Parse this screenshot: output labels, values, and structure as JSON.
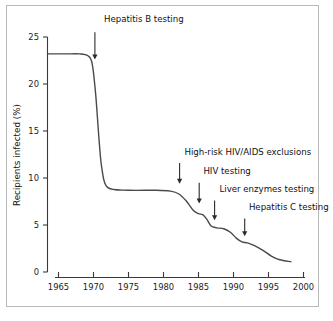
{
  "chart_data": {
    "type": "line",
    "title": "",
    "xlabel": "",
    "ylabel": "Recipients infected (%)",
    "xlim": [
      1963,
      2000
    ],
    "ylim": [
      0,
      25
    ],
    "xticks": [
      "1965",
      "1970",
      "1975",
      "1980",
      "1985",
      "1990",
      "1995",
      "2000"
    ],
    "xtick_values": [
      1965,
      1970,
      1975,
      1980,
      1985,
      1990,
      1995,
      2000
    ],
    "yticks": [
      "0",
      "5",
      "10",
      "15",
      "20",
      "25"
    ],
    "ytick_values": [
      0,
      5,
      10,
      15,
      20,
      25
    ],
    "grid": false,
    "legend": "none",
    "series": [
      {
        "name": "Recipients infected",
        "x": [
          1963.5,
          1966,
          1968,
          1969.2,
          1969.8,
          1970.3,
          1970.8,
          1971.2,
          1972,
          1975,
          1979,
          1981,
          1982.2,
          1983.2,
          1984.2,
          1985,
          1985.6,
          1986.2,
          1986.8,
          1987.6,
          1988.6,
          1989.6,
          1990.4,
          1991.2,
          1992,
          1993,
          1994.2,
          1995.4,
          1996.6,
          1998.2
        ],
        "y": [
          23.2,
          23.2,
          23.2,
          23.0,
          22.2,
          19.0,
          14.0,
          11.0,
          9.0,
          8.7,
          8.7,
          8.6,
          8.3,
          7.6,
          6.6,
          6.2,
          6.1,
          5.6,
          4.9,
          4.7,
          4.6,
          4.2,
          3.6,
          3.2,
          3.1,
          2.8,
          2.3,
          1.7,
          1.3,
          1.1
        ]
      }
    ],
    "annotations": [
      {
        "label": "Hepatitis B testing",
        "label_x": 1971.5,
        "label_y": 26.6,
        "arrow_x": 1970.2,
        "arrow_tip_y": 22.6,
        "arrow_tail_y": 25.5
      },
      {
        "label": "High-risk HIV/AIDS exclusions",
        "label_x": 1983.0,
        "label_y": 12.5,
        "arrow_x": 1982.3,
        "arrow_tip_y": 9.4,
        "arrow_tail_y": 11.6
      },
      {
        "label": "HIV testing",
        "label_x": 1985.7,
        "label_y": 10.4,
        "arrow_x": 1985.1,
        "arrow_tip_y": 7.3,
        "arrow_tail_y": 9.5
      },
      {
        "label": "Liver enzymes testing",
        "label_x": 1988.0,
        "label_y": 8.5,
        "arrow_x": 1987.3,
        "arrow_tip_y": 5.5,
        "arrow_tail_y": 7.6
      },
      {
        "label": "Hepatitis C testing",
        "label_x": 1992.2,
        "label_y": 6.6,
        "arrow_x": 1991.6,
        "arrow_tip_y": 3.8,
        "arrow_tail_y": 5.7
      }
    ]
  },
  "figure": {
    "axis_title_y": "Recipients infected (%)",
    "tick_1965": "1965",
    "tick_1970": "1970",
    "tick_1975": "1975",
    "tick_1980": "1980",
    "tick_1985": "1985",
    "tick_1990": "1990",
    "tick_1995": "1995",
    "tick_2000": "2000",
    "tick_y0": "0",
    "tick_y5": "5",
    "tick_y10": "10",
    "tick_y15": "15",
    "tick_y20": "20",
    "tick_y25": "25",
    "annot_hepb": "Hepatitis B testing",
    "annot_highrisk": "High-risk HIV/AIDS exclusions",
    "annot_hiv": "HIV testing",
    "annot_liver": "Liver enzymes testing",
    "annot_hepc": "Hepatitis C testing"
  },
  "colors": {
    "curve": "#4a4a4a",
    "axis": "#3a3a3a",
    "text": "#111111",
    "frame": "#b9b9b9",
    "background": "#ffffff"
  }
}
